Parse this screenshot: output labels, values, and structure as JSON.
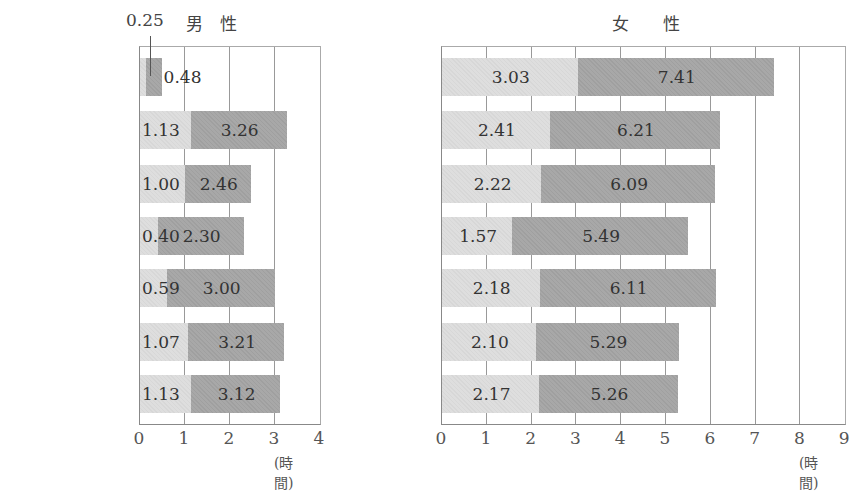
{
  "chart_data": [
    {
      "type": "bar",
      "stacked": "overlay (light segment = first value, dark segment extends to total)",
      "title": "男　性",
      "xlabel": "(時間)",
      "ylabel": "",
      "xlim": [
        0,
        4
      ],
      "xticks": [
        "0",
        "1",
        "2",
        "3",
        "4"
      ],
      "grid": true,
      "annotation": "0.25",
      "categories": [
        {
          "name": "日 本",
          "period": "(2001)"
        },
        {
          "name": "アメリカ",
          "period": "(2003)"
        },
        {
          "name": "イギリス",
          "period": "(2000-2001)"
        },
        {
          "name": "フランス",
          "period": "(1998-1999)"
        },
        {
          "name": "ドイツ",
          "period": "(2001-2002)"
        },
        {
          "name": "スウェーデン",
          "period": "(2000-2001)"
        },
        {
          "name": "ノルウェー",
          "period": "(2000-2001)"
        }
      ],
      "series": [
        {
          "name": "light",
          "color": "#dedede",
          "values": [
            0.25,
            1.13,
            1.0,
            0.4,
            0.59,
            1.07,
            1.13
          ],
          "labels": [
            "",
            "1.13",
            "1.00",
            "0.40",
            "0.59",
            "1.07",
            "1.13"
          ]
        },
        {
          "name": "dark (total)",
          "color": "#a8a8a8",
          "values": [
            0.48,
            3.26,
            2.46,
            2.3,
            3.0,
            3.21,
            3.12
          ],
          "labels": [
            "0.48",
            "3.26",
            "2.46",
            "2.30",
            "3.00",
            "3.21",
            "3.12"
          ]
        }
      ]
    },
    {
      "type": "bar",
      "stacked": "overlay (light segment = first value, dark segment extends to total)",
      "title": "女　　性",
      "xlabel": "(時間)",
      "ylabel": "",
      "xlim": [
        0,
        9
      ],
      "xticks": [
        "0",
        "1",
        "2",
        "3",
        "4",
        "5",
        "6",
        "7",
        "8",
        "9"
      ],
      "grid": true,
      "categories": [
        {
          "name": "日 本",
          "period": "(2001)"
        },
        {
          "name": "アメリカ",
          "period": "(2003)"
        },
        {
          "name": "イギリス",
          "period": "(2000-2001)"
        },
        {
          "name": "フランス",
          "period": "(1998-1999)"
        },
        {
          "name": "ドイツ",
          "period": "(2001-2002)"
        },
        {
          "name": "スウェーデン",
          "period": "(2000-2001)"
        },
        {
          "name": "ノルウェー",
          "period": "(2000-2001)"
        }
      ],
      "series": [
        {
          "name": "light",
          "color": "#dedede",
          "values": [
            3.03,
            2.41,
            2.22,
            1.57,
            2.18,
            2.1,
            2.17
          ],
          "labels": [
            "3.03",
            "2.41",
            "2.22",
            "1.57",
            "2.18",
            "2.10",
            "2.17"
          ]
        },
        {
          "name": "dark (total)",
          "color": "#a8a8a8",
          "values": [
            7.41,
            6.21,
            6.09,
            5.49,
            6.11,
            5.29,
            5.26
          ],
          "labels": [
            "7.41",
            "6.21",
            "6.09",
            "5.49",
            "6.11",
            "5.29",
            "5.26"
          ]
        }
      ]
    }
  ]
}
